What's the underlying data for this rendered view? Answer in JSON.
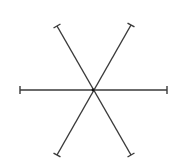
{
  "diagram": {
    "type": "asterisk",
    "background": "#ffffff",
    "line_color": "#3a3a3a",
    "line_width": 1.4,
    "tick_half_length": 4,
    "center": {
      "x": 93,
      "y": 90
    },
    "segments": [
      {
        "id": "horizontal",
        "x1": 20,
        "y1": 90,
        "x2": 167,
        "y2": 90
      },
      {
        "id": "diagonal-falling",
        "x1": 57,
        "y1": 26,
        "x2": 131,
        "y2": 155
      },
      {
        "id": "diagonal-rising",
        "x1": 131,
        "y1": 25,
        "x2": 57,
        "y2": 155
      }
    ]
  }
}
